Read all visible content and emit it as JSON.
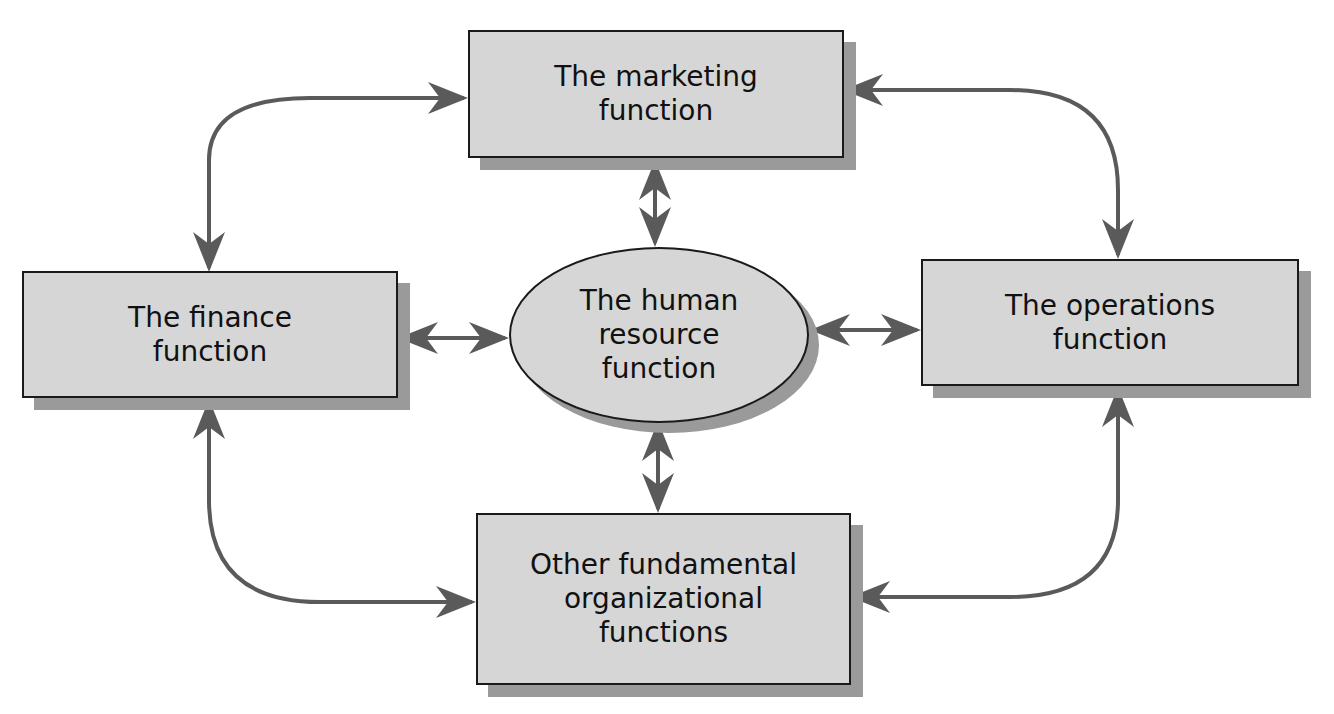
{
  "diagram": {
    "nodes": {
      "marketing": {
        "label": "The marketing\nfunction"
      },
      "finance": {
        "label": "The finance\nfunction"
      },
      "hr": {
        "label": "The human\nresource\nfunction"
      },
      "operations": {
        "label": "The operations\nfunction"
      },
      "other": {
        "label": "Other fundamental\norganizational\nfunctions"
      }
    },
    "edges": [
      {
        "from": "finance",
        "to": "marketing",
        "type": "bidirectional"
      },
      {
        "from": "marketing",
        "to": "operations",
        "type": "bidirectional"
      },
      {
        "from": "finance",
        "to": "other",
        "type": "bidirectional"
      },
      {
        "from": "operations",
        "to": "other",
        "type": "bidirectional"
      },
      {
        "from": "hr",
        "to": "marketing",
        "type": "bidirectional"
      },
      {
        "from": "hr",
        "to": "finance",
        "type": "bidirectional"
      },
      {
        "from": "hr",
        "to": "operations",
        "type": "bidirectional"
      },
      {
        "from": "hr",
        "to": "other",
        "type": "bidirectional"
      }
    ],
    "colors": {
      "box_fill": "#d6d6d6",
      "shadow": "#9a9a9a",
      "arrow": "#5a5a5a",
      "border": "#1a1a1a"
    }
  }
}
